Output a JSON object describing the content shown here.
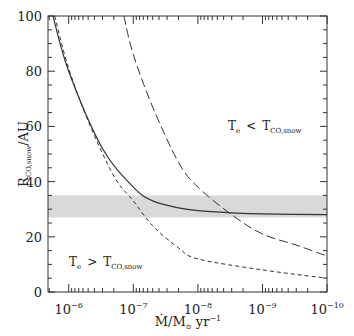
{
  "chart_data": {
    "type": "line",
    "title": "",
    "xlabel": "Ṁ/M⊙ yr⁻¹",
    "xlabel_parts": {
      "main": "Ṁ/M",
      "sub": "⊙",
      "tail": " yr",
      "sup": "−1"
    },
    "ylabel": "R_CO,snow/AU",
    "ylabel_parts": {
      "main": "R",
      "sub": "CO,snow",
      "tail": "/AU"
    },
    "x_scale": "log",
    "x_reversed": true,
    "xlim": [
      1.8e-06,
      1e-10
    ],
    "ylim": [
      0,
      100
    ],
    "x_ticks": [
      {
        "exp": "-6",
        "base": "10"
      },
      {
        "exp": "-7",
        "base": "10"
      },
      {
        "exp": "-8",
        "base": "10"
      },
      {
        "exp": "-9",
        "base": "10"
      },
      {
        "exp": "-10",
        "base": "10"
      }
    ],
    "y_ticks": [
      "0",
      "20",
      "40",
      "60",
      "80",
      "100"
    ],
    "grid": false,
    "shaded_band": {
      "y_min": 27,
      "y_max": 35,
      "color": "#d9d9d9"
    },
    "series": [
      {
        "name": "solid",
        "style": "solid",
        "x": [
          1.75e-06,
          1e-06,
          3e-07,
          1e-07,
          5e-08,
          2e-08,
          1e-08,
          3e-09,
          1e-09,
          1e-10
        ],
        "values": [
          100,
          80,
          52,
          38,
          33,
          30.5,
          29.5,
          28.7,
          28.3,
          28
        ]
      },
      {
        "name": "long-dashed",
        "style": "long-dash",
        "x": [
          1.4e-07,
          1e-07,
          5e-08,
          2e-08,
          1e-08,
          3e-09,
          1e-09,
          3e-10,
          1e-10
        ],
        "values": [
          100,
          86,
          67,
          47,
          38,
          28,
          21,
          17,
          13
        ]
      },
      {
        "name": "short-dashed",
        "style": "short-dash",
        "x": [
          1.65e-06,
          1e-06,
          5e-07,
          2e-07,
          1e-07,
          5e-08,
          2e-08,
          1e-08,
          1e-09,
          1e-10
        ],
        "values": [
          100,
          81,
          62,
          42,
          33,
          24,
          16,
          12,
          8,
          5
        ]
      }
    ],
    "annotations": [
      {
        "text_main": "T",
        "text_sub": "e",
        "op": "<",
        "rhs_main": "T",
        "rhs_sub": "CO,snow",
        "pos": "upper-right"
      },
      {
        "text_main": "T",
        "text_sub": "e",
        "op": ">",
        "rhs_main": "T",
        "rhs_sub": "CO,snow",
        "pos": "lower-left"
      }
    ]
  }
}
